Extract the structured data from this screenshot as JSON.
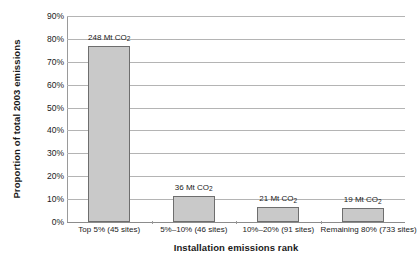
{
  "chart_data": {
    "type": "bar",
    "title": "",
    "xlabel": "Installation emissions rank",
    "ylabel": "Proportion of total 2003 emissions",
    "categories": [
      "Top 5% (45 sites)",
      "5%–10% (46 sites)",
      "10%–20% (91 sites)",
      "Remaining 80% (733 sites)"
    ],
    "values": [
      77,
      11.5,
      6.5,
      6
    ],
    "data_labels": [
      {
        "value": "248",
        "unit": "Mt CO",
        "sub": "2"
      },
      {
        "value": "36",
        "unit": "Mt CO",
        "sub": "2"
      },
      {
        "value": "21",
        "unit": "Mt CO",
        "sub": "2"
      },
      {
        "value": "19",
        "unit": "Mt CO",
        "sub": "2"
      }
    ],
    "ylim": [
      0,
      90
    ],
    "ytick_values": [
      90,
      80,
      70,
      60,
      50,
      40,
      30,
      20,
      10,
      0
    ],
    "yticklabels": [
      "90%",
      "80%",
      "70%",
      "60%",
      "50%",
      "40%",
      "30%",
      "20%",
      "10%",
      "0%"
    ],
    "grid": true,
    "legend": "none",
    "colors": {
      "bar_fill": "#c9c9c9",
      "bar_edge": "#6e6e6e",
      "gridline": "#b4b4b4",
      "axis": "#8c8c8c",
      "text": "#1a1a1a",
      "background": "#ffffff"
    }
  }
}
